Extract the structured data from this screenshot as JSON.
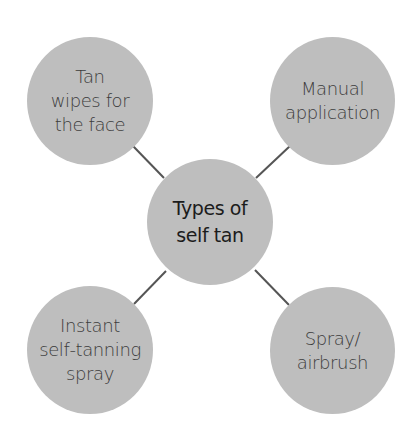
{
  "diagram": {
    "center": {
      "label": "Types of\nself tan"
    },
    "nodes": [
      {
        "id": "top-left",
        "label": "Tan\nwipes for\nthe face"
      },
      {
        "id": "top-right",
        "label": "Manual\napplication"
      },
      {
        "id": "bottom-left",
        "label": "Instant\nself-tanning\nspray"
      },
      {
        "id": "bottom-right",
        "label": "Spray/\nairbrush"
      }
    ],
    "colors": {
      "node_fill": "#bebebe",
      "connector": "#555555",
      "text": "#3c3c3c",
      "center_text": "#1c1c1c",
      "background": "#ffffff"
    }
  }
}
